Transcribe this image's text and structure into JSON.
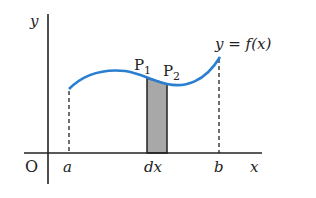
{
  "diagram": {
    "axes": {
      "x_label": "x",
      "y_label": "y",
      "origin_label": "O"
    },
    "function_label": "y = f(x)",
    "points": [
      {
        "label": "P",
        "sub": "1"
      },
      {
        "label": "P",
        "sub": "2"
      }
    ],
    "tick_labels": {
      "a": "a",
      "dx": "dx",
      "b": "b"
    },
    "colors": {
      "curve": "#2a7fd0",
      "strip": "#a8a8a8",
      "axis": "#222222"
    }
  }
}
